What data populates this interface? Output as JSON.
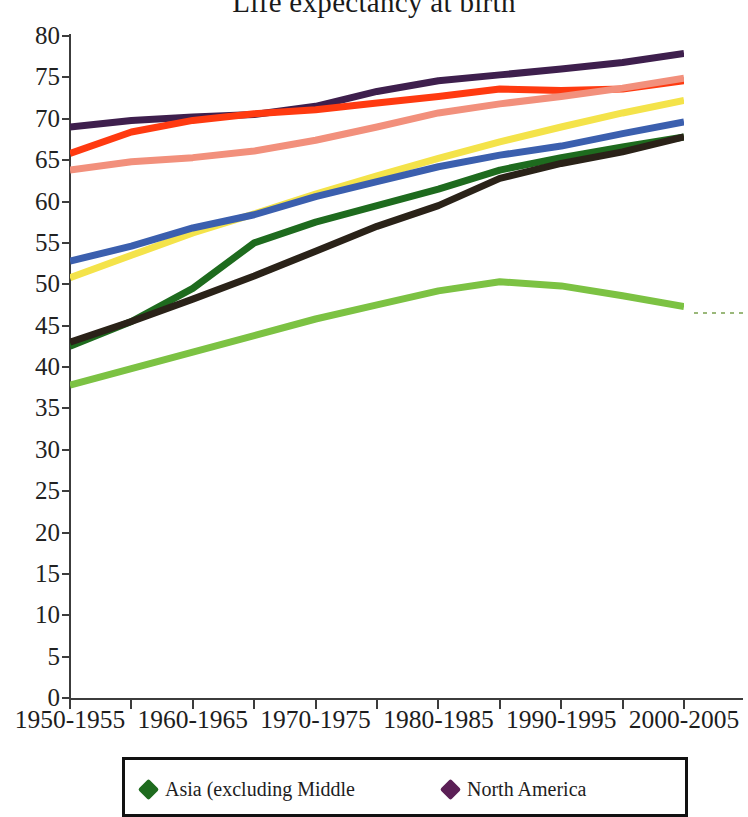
{
  "chart_data": {
    "type": "line",
    "title": "Life expectancy at birth",
    "xlabel": "",
    "ylabel": "",
    "ylim": [
      0,
      80
    ],
    "ytick_step": 5,
    "yticks": [
      0,
      5,
      10,
      15,
      20,
      25,
      30,
      35,
      40,
      45,
      50,
      55,
      60,
      65,
      70,
      75,
      80
    ],
    "grid": false,
    "legend_position": "bottom",
    "x": [
      "1950-1955",
      "1955-1960",
      "1960-1965",
      "1965-1970",
      "1970-1975",
      "1975-1980",
      "1980-1985",
      "1985-1990",
      "1990-1995",
      "1995-2000",
      "2000-2005"
    ],
    "xtick_labels": [
      "1950-1955",
      "1960-1965",
      "1970-1975",
      "1980-1985",
      "1990-1995",
      "2000-2005"
    ],
    "xtick_label_indices": [
      0,
      2,
      4,
      6,
      8,
      10
    ],
    "series": [
      {
        "name": "Northern America",
        "color": "#3E1F4D",
        "values": [
          69.0,
          69.8,
          70.2,
          70.5,
          71.5,
          73.3,
          74.6,
          75.3,
          76.0,
          76.8,
          77.9
        ]
      },
      {
        "name": "Europe",
        "color": "#FF3A10",
        "values": [
          65.8,
          68.4,
          69.8,
          70.6,
          71.1,
          71.9,
          72.7,
          73.6,
          73.4,
          73.6,
          74.6
        ]
      },
      {
        "name": "Oceania",
        "color": "#F2907C",
        "values": [
          63.8,
          64.8,
          65.3,
          66.1,
          67.4,
          69.0,
          70.7,
          71.8,
          72.7,
          73.7,
          74.9
        ]
      },
      {
        "name": "Latin America and the Caribbean",
        "color": "#F4E34A",
        "values": [
          50.8,
          53.5,
          56.2,
          58.5,
          60.9,
          63.1,
          65.2,
          67.2,
          69.0,
          70.7,
          72.2
        ]
      },
      {
        "name": "World",
        "color": "#3B5FAE",
        "values": [
          52.8,
          54.6,
          56.8,
          58.4,
          60.6,
          62.4,
          64.2,
          65.6,
          66.7,
          68.2,
          69.6
        ]
      },
      {
        "name": "Asia (excluding Middle Africa)",
        "color": "#1E6B1E",
        "values": [
          42.5,
          45.5,
          49.5,
          55.0,
          57.5,
          59.5,
          61.5,
          63.8,
          65.3,
          66.6,
          67.8
        ]
      },
      {
        "name": "Less developed regions",
        "color": "#2A2218",
        "values": [
          43.0,
          45.5,
          48.2,
          51.0,
          54.0,
          57.0,
          59.5,
          62.8,
          64.6,
          66.0,
          67.8
        ]
      },
      {
        "name": "Africa",
        "color": "#7CC243",
        "values": [
          37.8,
          39.8,
          41.8,
          43.8,
          45.8,
          47.5,
          49.2,
          50.3,
          49.8,
          48.6,
          47.3
        ]
      }
    ],
    "legend_entries": [
      {
        "label": "Asia (excluding Middle",
        "color": "#1E6B1E"
      },
      {
        "label": "North America",
        "color": "#5B1F56"
      }
    ]
  }
}
